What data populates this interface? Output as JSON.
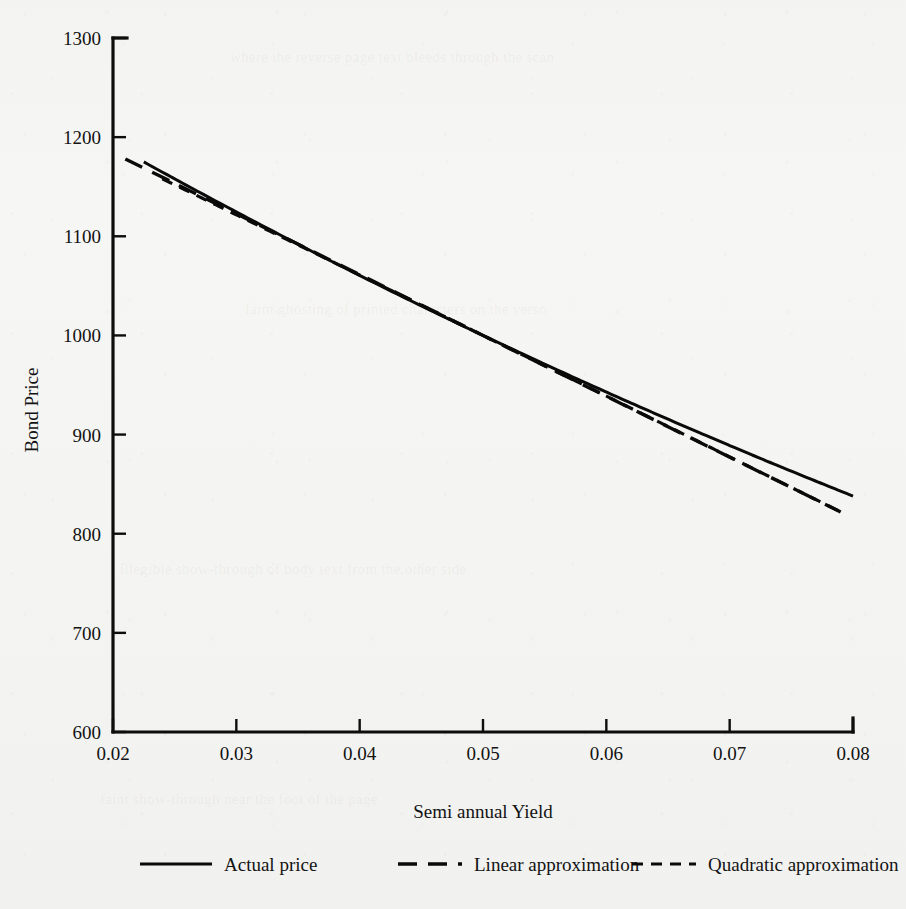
{
  "figure": {
    "background_color": "#f4f4f2",
    "ink_color": "#0d0d0d"
  },
  "chart_data": {
    "type": "line",
    "title": "",
    "xlabel": "Semi annual Yield",
    "ylabel": "Bond Price",
    "xlim": [
      0.02,
      0.08
    ],
    "ylim": [
      600,
      1300
    ],
    "xticks": [
      "0.02",
      "0.03",
      "0.04",
      "0.05",
      "0.06",
      "0.07",
      "0.08"
    ],
    "xtick_values": [
      0.02,
      0.03,
      0.04,
      0.05,
      0.06,
      0.07,
      0.08
    ],
    "yticks": [
      "600",
      "700",
      "800",
      "900",
      "1000",
      "1100",
      "1200",
      "1300"
    ],
    "ytick_values": [
      600,
      700,
      800,
      900,
      1000,
      1100,
      1200,
      1300
    ],
    "grid": false,
    "legend_position": "below-axes",
    "tangency_point": {
      "x": 0.05,
      "y": 1000
    },
    "series": [
      {
        "name": "Actual price",
        "style": "solid",
        "x": [
          0.0225,
          0.025,
          0.0275,
          0.03,
          0.0325,
          0.035,
          0.0375,
          0.04,
          0.0425,
          0.045,
          0.0475,
          0.05,
          0.0525,
          0.055,
          0.0575,
          0.06,
          0.0625,
          0.065,
          0.0675,
          0.07,
          0.0725,
          0.075,
          0.0775,
          0.08
        ],
        "values": [
          1175,
          1157,
          1135,
          1112,
          1090,
          1069,
          1048,
          1028,
          1009,
          991,
          973,
          1000,
          957,
          941,
          925,
          910,
          896,
          882,
          869,
          866,
          856,
          850,
          844,
          838
        ]
      },
      {
        "name": "Linear approximation",
        "style": "long-dash",
        "x": [
          0.021,
          0.03,
          0.04,
          0.05,
          0.06,
          0.07,
          0.079
        ],
        "values": [
          1145,
          1079,
          1040,
          1000,
          931,
          861,
          789
        ]
      },
      {
        "name": "Quadratic approximation",
        "style": "short-dash",
        "x": [
          0.024,
          0.03,
          0.04,
          0.05,
          0.06,
          0.07,
          0.079
        ],
        "values": [
          1158,
          1102,
          1046,
          1000,
          921,
          871,
          822
        ]
      }
    ]
  },
  "legend": {
    "entries": [
      {
        "label": "Actual price",
        "style": "solid"
      },
      {
        "label": "Linear approximation",
        "style": "long-dash"
      },
      {
        "label": "Quadratic approximation",
        "style": "short-dash"
      }
    ]
  },
  "showthrough": {
    "top": "where the reverse page text bleeds through the scan",
    "middle": "faint ghosting of printed characters on the verso",
    "lower": "illegible show-through of body text from the other side",
    "bottom": "faint show-through near the foot of the page"
  }
}
